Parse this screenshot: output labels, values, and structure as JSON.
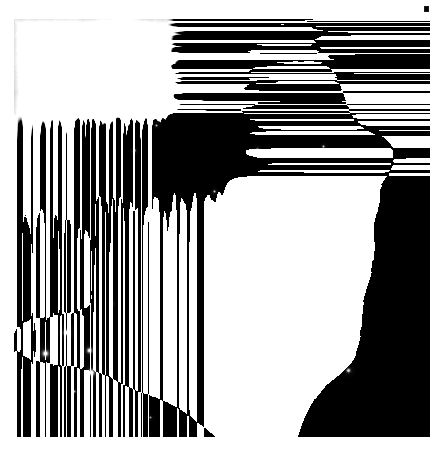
{
  "viewer": {
    "title": "Nebula Image Viewer",
    "background_color": "#ffffff"
  },
  "image": {
    "name": "orion-nebula-grayscale",
    "alt_text": "Grayscale astronomical image of the Orion Nebula (M42) core region",
    "colorspace": "grayscale",
    "frame": {
      "left": 14,
      "top": 19,
      "width": 416,
      "height": 418
    },
    "border_color": "#000000",
    "darkest_value": "#040404",
    "brightest_value": "#ffffff"
  },
  "marker": {
    "name": "corner-marker",
    "label": "",
    "color": "#1a1a1a",
    "position": {
      "x": 424,
      "y": 6
    }
  },
  "chart_data": {
    "type": "heatmap",
    "title": "",
    "xlabel": "",
    "ylabel": "",
    "colormap": "gray",
    "vmin": 0,
    "vmax": 255,
    "grid": false,
    "legend": "none",
    "width": 416,
    "height": 418,
    "background_level": 8,
    "nebula_blobs": [
      {
        "x": 200,
        "y": 225,
        "rx": 62,
        "ry": 52,
        "rot": -28,
        "level": 252,
        "falloff": 2.1
      },
      {
        "x": 186,
        "y": 212,
        "rx": 34,
        "ry": 28,
        "rot": -20,
        "level": 255,
        "falloff": 2.4
      },
      {
        "x": 222,
        "y": 248,
        "rx": 40,
        "ry": 32,
        "rot": -35,
        "level": 246,
        "falloff": 2.2
      },
      {
        "x": 168,
        "y": 250,
        "rx": 46,
        "ry": 40,
        "rot": 15,
        "level": 224,
        "falloff": 1.9
      },
      {
        "x": 246,
        "y": 206,
        "rx": 44,
        "ry": 36,
        "rot": -40,
        "level": 206,
        "falloff": 1.8
      },
      {
        "x": 150,
        "y": 300,
        "rx": 64,
        "ry": 34,
        "rot": 42,
        "level": 218,
        "falloff": 1.7
      },
      {
        "x": 112,
        "y": 272,
        "rx": 40,
        "ry": 24,
        "rot": 45,
        "level": 200,
        "falloff": 1.8
      },
      {
        "x": 196,
        "y": 318,
        "rx": 50,
        "ry": 36,
        "rot": -15,
        "level": 196,
        "falloff": 1.7
      },
      {
        "x": 258,
        "y": 286,
        "rx": 54,
        "ry": 48,
        "rot": -30,
        "level": 184,
        "falloff": 1.6
      },
      {
        "x": 150,
        "y": 160,
        "rx": 58,
        "ry": 44,
        "rot": -35,
        "level": 150,
        "falloff": 1.5
      },
      {
        "x": 222,
        "y": 128,
        "rx": 70,
        "ry": 48,
        "rot": -42,
        "level": 140,
        "falloff": 1.4
      },
      {
        "x": 286,
        "y": 96,
        "rx": 62,
        "ry": 44,
        "rot": -50,
        "level": 122,
        "falloff": 1.4
      },
      {
        "x": 300,
        "y": 170,
        "rx": 64,
        "ry": 52,
        "rot": -35,
        "level": 126,
        "falloff": 1.4
      },
      {
        "x": 96,
        "y": 210,
        "rx": 50,
        "ry": 40,
        "rot": 20,
        "level": 132,
        "falloff": 1.5
      },
      {
        "x": 70,
        "y": 170,
        "rx": 44,
        "ry": 30,
        "rot": 30,
        "level": 112,
        "falloff": 1.5
      },
      {
        "x": 118,
        "y": 128,
        "rx": 40,
        "ry": 28,
        "rot": -20,
        "level": 104,
        "falloff": 1.5
      },
      {
        "x": 330,
        "y": 240,
        "rx": 56,
        "ry": 50,
        "rot": -20,
        "level": 96,
        "falloff": 1.4
      },
      {
        "x": 254,
        "y": 352,
        "rx": 62,
        "ry": 44,
        "rot": 10,
        "level": 110,
        "falloff": 1.4
      },
      {
        "x": 180,
        "y": 382,
        "rx": 70,
        "ry": 36,
        "rot": 18,
        "level": 86,
        "falloff": 1.4
      },
      {
        "x": 318,
        "y": 320,
        "rx": 48,
        "ry": 40,
        "rot": -25,
        "level": 72,
        "falloff": 1.4
      },
      {
        "x": 366,
        "y": 140,
        "rx": 44,
        "ry": 60,
        "rot": -10,
        "level": 60,
        "falloff": 1.3
      },
      {
        "x": 60,
        "y": 320,
        "rx": 50,
        "ry": 40,
        "rot": 30,
        "level": 66,
        "falloff": 1.4
      },
      {
        "x": 210,
        "y": 60,
        "rx": 64,
        "ry": 34,
        "rot": -30,
        "level": 72,
        "falloff": 1.3
      },
      {
        "x": 118,
        "y": 346,
        "rx": 40,
        "ry": 26,
        "rot": 40,
        "level": 62,
        "falloff": 1.5
      }
    ],
    "dark_blobs": [
      {
        "x": 54,
        "y": 96,
        "rx": 76,
        "ry": 70,
        "rot": 0,
        "level": 120,
        "falloff": 1.6
      },
      {
        "x": 30,
        "y": 40,
        "rx": 60,
        "ry": 50,
        "rot": 0,
        "level": 120,
        "falloff": 1.6
      },
      {
        "x": 82,
        "y": 210,
        "rx": 48,
        "ry": 46,
        "rot": 0,
        "level": 96,
        "falloff": 1.7
      },
      {
        "x": 40,
        "y": 250,
        "rx": 52,
        "ry": 56,
        "rot": 0,
        "level": 104,
        "falloff": 1.6
      },
      {
        "x": 380,
        "y": 60,
        "rx": 76,
        "ry": 70,
        "rot": 0,
        "level": 110,
        "falloff": 1.5
      },
      {
        "x": 392,
        "y": 200,
        "rx": 60,
        "ry": 90,
        "rot": 0,
        "level": 100,
        "falloff": 1.4
      },
      {
        "x": 396,
        "y": 330,
        "rx": 62,
        "ry": 80,
        "rot": 0,
        "level": 100,
        "falloff": 1.4
      },
      {
        "x": 60,
        "y": 396,
        "rx": 76,
        "ry": 56,
        "rot": 0,
        "level": 96,
        "falloff": 1.5
      },
      {
        "x": 150,
        "y": 404,
        "rx": 66,
        "ry": 44,
        "rot": 0,
        "level": 80,
        "falloff": 1.5
      },
      {
        "x": 292,
        "y": 240,
        "rx": 30,
        "ry": 22,
        "rot": 25,
        "level": 70,
        "falloff": 1.8
      },
      {
        "x": 142,
        "y": 178,
        "rx": 16,
        "ry": 30,
        "rot": 8,
        "level": 84,
        "falloff": 2.0
      },
      {
        "x": 166,
        "y": 150,
        "rx": 13,
        "ry": 20,
        "rot": -10,
        "level": 72,
        "falloff": 2.0
      },
      {
        "x": 256,
        "y": 318,
        "rx": 34,
        "ry": 24,
        "rot": -18,
        "level": 62,
        "falloff": 1.8
      },
      {
        "x": 338,
        "y": 386,
        "rx": 50,
        "ry": 38,
        "rot": 0,
        "level": 76,
        "falloff": 1.5
      },
      {
        "x": 110,
        "y": 62,
        "rx": 44,
        "ry": 34,
        "rot": 0,
        "level": 70,
        "falloff": 1.6
      }
    ],
    "bright_bar": {
      "x1": 60,
      "y1": 330,
      "x2": 230,
      "y2": 200,
      "thickness": 9,
      "level": 235
    },
    "filaments": [
      {
        "x1": 74,
        "y1": 324,
        "x2": 226,
        "y2": 198,
        "w": 5,
        "level": 230
      },
      {
        "x1": 96,
        "y1": 352,
        "x2": 206,
        "y2": 254,
        "w": 4,
        "level": 210
      },
      {
        "x1": 118,
        "y1": 390,
        "x2": 196,
        "y2": 300,
        "w": 3,
        "level": 150
      },
      {
        "x1": 212,
        "y1": 262,
        "x2": 286,
        "y2": 212,
        "w": 3,
        "level": 200
      },
      {
        "x1": 184,
        "y1": 108,
        "x2": 262,
        "y2": 70,
        "w": 3,
        "level": 110
      },
      {
        "x1": 84,
        "y1": 236,
        "x2": 158,
        "y2": 206,
        "w": 3,
        "level": 150
      },
      {
        "x1": 244,
        "y1": 328,
        "x2": 312,
        "y2": 358,
        "w": 3,
        "level": 104
      },
      {
        "x1": 296,
        "y1": 148,
        "x2": 350,
        "y2": 182,
        "w": 3,
        "level": 96
      }
    ],
    "stars": [
      {
        "x": 52,
        "y": 313,
        "r": 2.8,
        "level": 255
      },
      {
        "x": 31,
        "y": 334,
        "r": 3.2,
        "level": 255
      },
      {
        "x": 75,
        "y": 331,
        "r": 2.6,
        "level": 250
      },
      {
        "x": 77,
        "y": 353,
        "r": 3.4,
        "level": 255
      },
      {
        "x": 334,
        "y": 351,
        "r": 2.0,
        "level": 230
      },
      {
        "x": 120,
        "y": 131,
        "r": 1.3,
        "level": 225
      },
      {
        "x": 243,
        "y": 130,
        "r": 1.3,
        "level": 220
      },
      {
        "x": 187,
        "y": 88,
        "r": 1.2,
        "level": 210
      },
      {
        "x": 142,
        "y": 106,
        "r": 1.1,
        "level": 200
      },
      {
        "x": 309,
        "y": 127,
        "r": 1.2,
        "level": 205
      },
      {
        "x": 275,
        "y": 176,
        "r": 1.2,
        "level": 215
      },
      {
        "x": 200,
        "y": 172,
        "r": 1.2,
        "level": 212
      },
      {
        "x": 60,
        "y": 372,
        "r": 1.2,
        "level": 190
      },
      {
        "x": 136,
        "y": 398,
        "r": 1.1,
        "level": 170
      },
      {
        "x": 318,
        "y": 268,
        "r": 1.3,
        "level": 205
      },
      {
        "x": 97,
        "y": 284,
        "r": 1.4,
        "level": 225
      }
    ]
  }
}
